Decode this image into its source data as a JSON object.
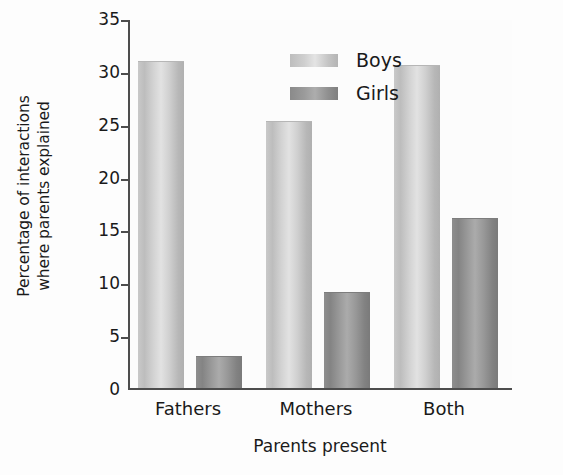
{
  "chart_data": {
    "type": "bar",
    "title": "",
    "subtitle": "",
    "xlabel": "Parents present",
    "ylabel": "Percentage of interactions where parents explained",
    "ylabel_lines": [
      "Percentage of interactions",
      "where parents explained"
    ],
    "categories": [
      "Fathers",
      "Mothers",
      "Both"
    ],
    "series": [
      {
        "name": "Boys",
        "color": "#d2d2d2",
        "values": [
          30.8,
          25.2,
          30.5
        ]
      },
      {
        "name": "Girls",
        "color": "#8f8f8f",
        "values": [
          2.9,
          9.0,
          16.0
        ]
      }
    ],
    "ylim": [
      0,
      35
    ],
    "yticks": [
      0,
      5,
      10,
      15,
      20,
      25,
      30,
      35
    ],
    "ytick_labels": [
      "0",
      "5",
      "10",
      "15",
      "20",
      "25",
      "30",
      "35"
    ],
    "grid": false,
    "legend_position": "upper-center-inside",
    "legend_entries": [
      "Boys",
      "Girls"
    ],
    "axis_color": "#4d4d4d"
  }
}
